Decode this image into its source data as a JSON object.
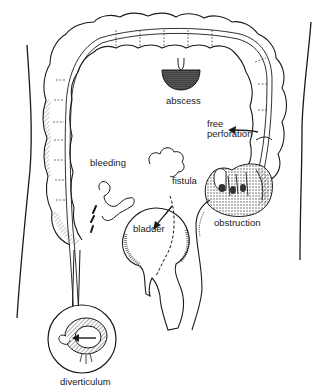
{
  "figure": {
    "colors": {
      "ink": "#1a1a1a",
      "background": "#ffffff",
      "stipple": "#555555"
    }
  },
  "labels": {
    "abscess": "abscess",
    "free_perforation_line1": "free",
    "free_perforation_line2": "perforation",
    "bleeding": "bleeding",
    "fistula": "fistula",
    "bladder": "bladder",
    "obstruction": "obstruction",
    "diverticulum": "diverticulum"
  }
}
